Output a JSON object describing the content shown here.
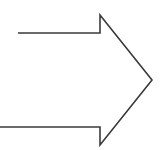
{
  "diagram": {
    "shape": "right-arrow",
    "stroke_color": "#3a3a3a",
    "stroke_width": 1.6,
    "fill": "none",
    "points": "18,33 100,33 100,15 152,80 100,145 100,127 0,127"
  }
}
